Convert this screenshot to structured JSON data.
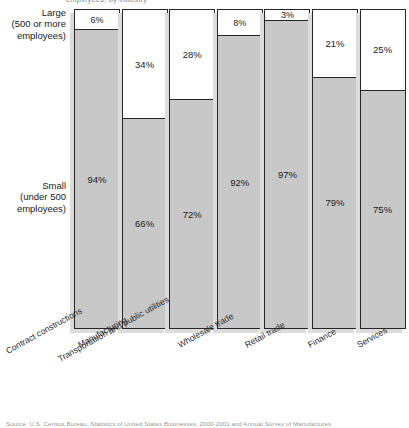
{
  "figure": {
    "top_cut_text": "employees, by industry",
    "source_cut_text": "Source: U.S. Census Bureau, Statistics of United States Businesses, 2000-2001 and Annual Survey of Manufactures"
  },
  "axis": {
    "large_label": "Large\n(500 or more\nemployees)",
    "small_label": "Small\n(under 500\nemployees)"
  },
  "legend": {
    "large": "Large (500 or more employees)",
    "small": "Small (under 500 employees)"
  },
  "colors": {
    "large_fill": "#ffffff",
    "small_fill": "#c8c8c8",
    "outline": "#262626",
    "shadow": "#dcdcdc",
    "background": "#ffffff"
  },
  "chart_data": {
    "type": "bar",
    "title": "",
    "subtitle": "",
    "stacked": true,
    "normalized_percent": true,
    "xlabel": "",
    "ylabel": "",
    "ylim": [
      0,
      100
    ],
    "grid": false,
    "legend_position": "left-axis-labels",
    "categories": [
      "Contract constructions",
      "Manufacturing",
      "Transportation and public utilities",
      "Wholesale trade",
      "Retail trade",
      "Finance",
      "Services"
    ],
    "series": [
      {
        "name": "Large (500 or more employees)",
        "values": [
          6,
          34,
          28,
          8,
          3,
          21,
          25
        ],
        "labels": [
          "6%",
          "34%",
          "28%",
          "8%",
          "3%",
          "21%",
          "25%"
        ],
        "color": "#ffffff"
      },
      {
        "name": "Small (under 500 employees)",
        "values": [
          94,
          66,
          72,
          92,
          97,
          79,
          75
        ],
        "labels": [
          "94%",
          "66%",
          "72%",
          "92%",
          "97%",
          "79%",
          "75%"
        ],
        "color": "#c8c8c8"
      }
    ]
  }
}
